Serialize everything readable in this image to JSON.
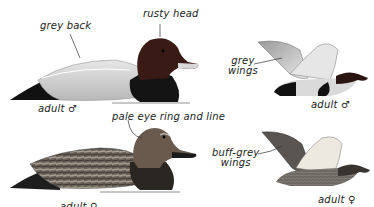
{
  "plate": {
    "subject": "pochard-type diving duck identification plate",
    "colors": {
      "male_head": "#3a1a14",
      "male_back": "#d9d9d9",
      "male_breast": "#151515",
      "female_head": "#6a5a4e",
      "female_body": "#5a524a",
      "water_line": "#c8c8c8"
    }
  },
  "labels": {
    "grey_back": "grey back",
    "rusty_head": "rusty head",
    "adult_male_swimming": "adult ♂",
    "grey_wings_line1": "grey",
    "grey_wings_line2": "wings",
    "adult_male_flying": "adult ♂",
    "pale_eye_ring": "pale eye ring and line",
    "buff_grey_wings_line1": "buff-grey",
    "buff_grey_wings_line2": "wings",
    "adult_female_flying": "adult ♀",
    "adult_female_swimming": "adult ♀"
  }
}
